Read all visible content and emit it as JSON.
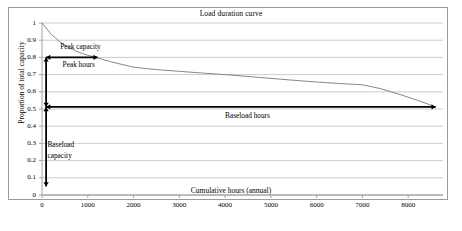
{
  "chart_data": {
    "type": "line",
    "title": "Load duration curve",
    "xlabel": "Cumulative hours (annual)",
    "ylabel": "Proportion of total capacity",
    "xlim": [
      0,
      8760
    ],
    "ylim": [
      0,
      1
    ],
    "grid": true,
    "legend": "none",
    "x_ticks": [
      "0",
      "1000",
      "2000",
      "3000",
      "4000",
      "5000",
      "6000",
      "7000",
      "8000"
    ],
    "x_tick_values": [
      0,
      1000,
      2000,
      3000,
      4000,
      5000,
      6000,
      7000,
      8000
    ],
    "y_ticks": [
      "0",
      "0.1",
      "0.2",
      "0.3",
      "0.4",
      "0.5",
      "0.6",
      "0.7",
      "0.8",
      "0.9",
      "1"
    ],
    "y_tick_values": [
      0,
      0.1,
      0.2,
      0.3,
      0.4,
      0.5,
      0.6,
      0.7,
      0.8,
      0.9,
      1
    ],
    "series": [
      {
        "name": "Load duration curve",
        "x": [
          0,
          200,
          400,
          600,
          800,
          1000,
          1200,
          1500,
          2000,
          2500,
          3000,
          3500,
          4000,
          4500,
          5000,
          5500,
          6000,
          6500,
          7000,
          7400,
          7800,
          8200,
          8600
        ],
        "values": [
          1.0,
          0.935,
          0.888,
          0.855,
          0.83,
          0.812,
          0.798,
          0.775,
          0.743,
          0.729,
          0.719,
          0.709,
          0.7,
          0.689,
          0.678,
          0.667,
          0.657,
          0.648,
          0.641,
          0.618,
          0.586,
          0.551,
          0.512
        ]
      }
    ],
    "annotations": [
      {
        "id": "peak-capacity",
        "label": "Peak capacity",
        "kind": "text",
        "x": 400,
        "y": 0.862
      },
      {
        "id": "peak-hours",
        "label": "Peak hours",
        "kind": "text",
        "x": 450,
        "y": 0.758
      },
      {
        "id": "baseload-hours",
        "label": "Baseload hours",
        "kind": "text",
        "x": 4000,
        "y": 0.462
      },
      {
        "id": "baseload-capacity",
        "label_line1": "Baseload",
        "label_line2": "capacity",
        "kind": "text",
        "x": 120,
        "y": 0.29
      },
      {
        "id": "capacity-span-arrow",
        "kind": "double-arrow-vertical",
        "x": 90,
        "y_from": 0.05,
        "y_to": 0.8
      },
      {
        "id": "peak-hours-arrow",
        "kind": "double-arrow-horizontal",
        "y": 0.8,
        "x_from": 90,
        "x_to": 1215
      },
      {
        "id": "baseload-hours-arrow",
        "kind": "double-arrow-horizontal",
        "y": 0.512,
        "x_from": 90,
        "x_to": 8600
      }
    ],
    "colors": {
      "curve": "#808080",
      "grid": "#bfbfbf",
      "axis": "#9a9a9a",
      "annotation": "#000000",
      "background": "#ffffff"
    }
  }
}
